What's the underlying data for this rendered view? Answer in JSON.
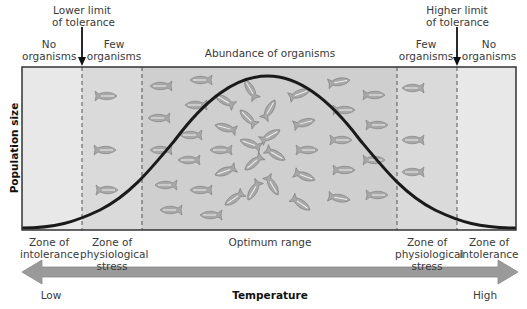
{
  "title_labels": {
    "lower_limit": [
      "Lower limit",
      "of tolerance"
    ],
    "higher_limit": [
      "Higher limit",
      "of tolerance"
    ],
    "abundance": "Abundance of organisms"
  },
  "top_zone_labels": [
    {
      "lines": [
        "No",
        "organisms"
      ]
    },
    {
      "lines": [
        "Few",
        "organisms"
      ]
    },
    {
      "lines": [
        "Few",
        "organisms"
      ]
    },
    {
      "lines": [
        "No",
        "organisms"
      ]
    }
  ],
  "bottom_zone_labels": [
    {
      "lines": [
        "Zone of",
        "intolerance"
      ]
    },
    {
      "lines": [
        "Zone of",
        "physiological",
        "stress"
      ]
    },
    {
      "lines": [
        "Optimum range"
      ]
    },
    {
      "lines": [
        "Zone of",
        "physiological",
        "stress"
      ]
    },
    {
      "lines": [
        "Zone of",
        "intolerance"
      ]
    }
  ],
  "axes": {
    "y_label": "Population size",
    "x_label": "Temperature",
    "x_low": "Low",
    "x_high": "High"
  },
  "colors": {
    "intolerance_zone": "#e8e8e8",
    "stress_zone": "#d9d9d9",
    "optimum_zone": "#cfcfcf",
    "curve": "#1a1a1a",
    "arrow": "#9a9a9a",
    "fish": "#a8a8a8"
  },
  "icons": {
    "fish": "fish-icon",
    "down_arrow": "down-arrow-icon",
    "double_arrow": "double-arrow-icon"
  }
}
